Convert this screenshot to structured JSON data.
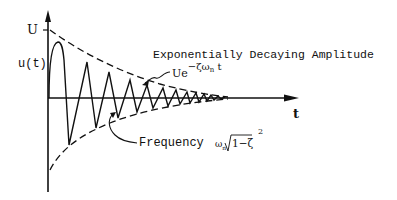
{
  "diagram": {
    "title": "Exponentially Decaying Amplitude",
    "axes": {
      "y_label_top": "U",
      "y_label_func": "u(t)",
      "x_label": "t"
    },
    "envelope_label": {
      "base": "Ue",
      "exponent": "−ζω",
      "exponent_sub": "n",
      "exponent_tail": " t"
    },
    "frequency_label": {
      "text": "Frequency",
      "omega": "ω",
      "omega_sub": "n",
      "radical_body": "1−ζ",
      "power": "2"
    },
    "colors": {
      "ink": "#111111",
      "background": "#ffffff"
    }
  }
}
